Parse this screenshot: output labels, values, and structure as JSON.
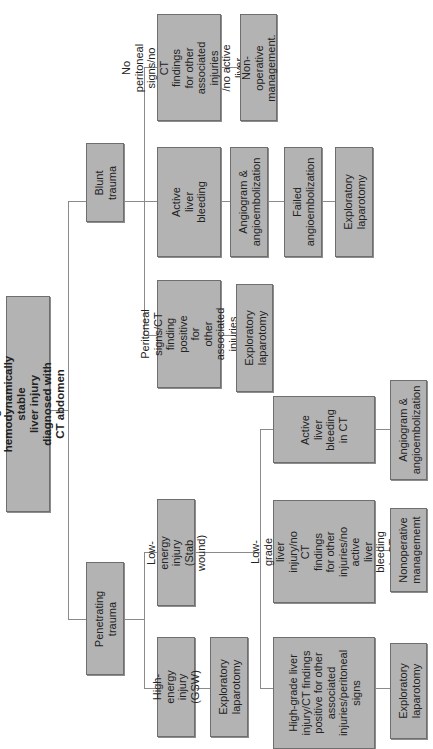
{
  "diagram": {
    "title": "Management of hemodynamically stable liver injury diagnosed with CT abdomen",
    "orientation": "rotated 90 degrees counter-clockwise (reads bottom-to-top)",
    "box_fill": "#b3b3b3",
    "box_border": "#6e6e6e",
    "connector_color": "#8a8a8a",
    "nodes": {
      "root": "Management of hemodynamically stable\nliver injury diagnosed with CT abdomen",
      "blunt": "Blunt trauma",
      "penetrating": "Penetrating trauma",
      "blunt_no_signs": "No peritoneal\nsigns/no CT\nfindings for other\nassociated injuries\n/no active liver\nbleeding",
      "blunt_nonop": "Non-operative\nmanagement.",
      "blunt_active": "Active liver\nbleeding",
      "blunt_angio": "Angiogram &\nangioembolization",
      "blunt_failed": "Failed\nangioembolization",
      "blunt_explap2": "Exploratory\nlaparotomy",
      "blunt_peritoneal": "Peritoneal signs/CT\nfinding positive for\nother associated\ninjuries",
      "blunt_explap1": "Exploratory\nlaparotomy",
      "pen_low": "Low-energy injury\n(Stab wound)",
      "pen_high": "High-energy\ninjury (GSW)",
      "pen_high_explap": "Exploratory\nlaparotomy",
      "low_active": "Active liver\nbleeding\nin CT",
      "low_active_angio": "Angiogram &\nangioembolization",
      "low_lowgrade": "Low-grade\nliver injury/no\nCT findings\nfor other\ninjuries/no\nactive liver\nbleeding in CT",
      "low_lowgrade_nonop": "Nonoperative\nmanagememt",
      "low_highgrade": "High-grade liver\ninjury/CT findings\npositive for other\nassociated\ninjuries/peritoneal\nsigns",
      "low_highgrade_explap": "Exploratory\nlaparotomy"
    }
  }
}
